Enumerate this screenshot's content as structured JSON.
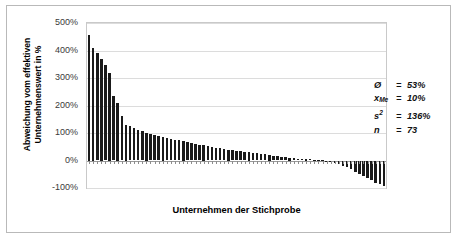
{
  "chart_data": {
    "type": "bar",
    "title": "",
    "xlabel": "Unternehmen der Stichprobe",
    "ylabel": "Abweichung vom effektiven Unternehmenswert in %",
    "ylabel_line1": "Abweichung vom effektiven",
    "ylabel_line2": "Unternehmenswert in %",
    "ylim": [
      -100,
      500
    ],
    "ytick_labels": [
      "500%",
      "400%",
      "300%",
      "200%",
      "100%",
      "0%",
      "-100%"
    ],
    "ytick_values": [
      500,
      400,
      300,
      200,
      100,
      0,
      -100
    ],
    "grid": true,
    "legend": "none",
    "categories_label": "Unternehmen der Stichprobe (73 Unternehmen, sortiert absteigend)",
    "values": [
      455,
      410,
      392,
      370,
      346,
      320,
      236,
      210,
      162,
      130,
      124,
      118,
      112,
      106,
      100,
      96,
      92,
      88,
      85,
      82,
      79,
      76,
      73,
      70,
      67,
      64,
      61,
      58,
      55,
      52,
      49,
      46,
      44,
      42,
      40,
      38,
      36,
      34,
      32,
      30,
      28,
      26,
      24,
      22,
      20,
      18,
      16,
      14,
      12,
      10,
      8,
      7,
      6,
      5,
      4,
      3,
      2,
      1,
      -2,
      -5,
      -9,
      -14,
      -19,
      -25,
      -32,
      -40,
      -48,
      -56,
      -64,
      -72,
      -80,
      -86,
      -92
    ],
    "n": 73,
    "series": [
      {
        "name": "Abweichung vom effektiven Unternehmenswert",
        "values": [
          455,
          410,
          392,
          370,
          346,
          320,
          236,
          210,
          162,
          130,
          124,
          118,
          112,
          106,
          100,
          96,
          92,
          88,
          85,
          82,
          79,
          76,
          73,
          70,
          67,
          64,
          61,
          58,
          55,
          52,
          49,
          46,
          44,
          42,
          40,
          38,
          36,
          34,
          32,
          30,
          28,
          26,
          24,
          22,
          20,
          18,
          16,
          14,
          12,
          10,
          8,
          7,
          6,
          5,
          4,
          3,
          2,
          1,
          -2,
          -5,
          -9,
          -14,
          -19,
          -25,
          -32,
          -40,
          -48,
          -56,
          -64,
          -72,
          -80,
          -86,
          -92
        ]
      }
    ],
    "bar_color": "#1a1a1a"
  },
  "stats": {
    "mean": {
      "symbol": "Ø",
      "eq": "=",
      "value": "53%"
    },
    "median": {
      "symbol": "x",
      "subscript": "Me",
      "eq": "=",
      "value": "10%"
    },
    "variance": {
      "symbol": "s",
      "superscript": "2",
      "eq": "=",
      "value": "136%"
    },
    "count": {
      "symbol": "n",
      "eq": "=",
      "value": "73"
    }
  }
}
